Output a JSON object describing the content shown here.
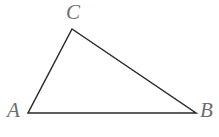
{
  "figure": {
    "kind": "geometry-diagram",
    "shape": "triangle",
    "canvas": {
      "width": 219,
      "height": 137,
      "background": "#ffffff"
    },
    "stroke": {
      "color": "#2b2b2b",
      "width": 1.5
    },
    "label_color": "#6d6d6d",
    "vertices": [
      {
        "name": "A",
        "label": "A",
        "x": 28,
        "y": 113,
        "label_x": 7,
        "label_y": 100
      },
      {
        "name": "B",
        "label": "B",
        "x": 196,
        "y": 113,
        "label_x": 200,
        "label_y": 100
      },
      {
        "name": "C",
        "label": "C",
        "x": 72,
        "y": 29,
        "label_x": 66,
        "label_y": 2
      }
    ],
    "edges": [
      {
        "name": "AB",
        "from": "A",
        "to": "B"
      },
      {
        "name": "BC",
        "from": "B",
        "to": "C"
      },
      {
        "name": "CA",
        "from": "C",
        "to": "A"
      }
    ],
    "polygon_points": "28,113 196,113 72,29"
  }
}
